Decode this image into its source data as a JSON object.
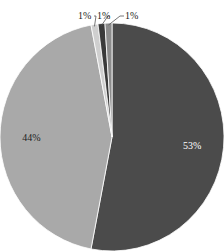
{
  "chart_data": {
    "type": "pie",
    "title": "",
    "slices": [
      {
        "label": "53%",
        "value": 53,
        "color": "#4b4b4b"
      },
      {
        "label": "44%",
        "value": 44,
        "color": "#a9a9a9"
      },
      {
        "label": "1%",
        "value": 1,
        "color": "#cfcfcf"
      },
      {
        "label": "1%",
        "value": 1,
        "color": "#3a3a3a"
      },
      {
        "label": "1%",
        "value": 1,
        "color": "#8c8c8c"
      }
    ],
    "start_angle": "12 o'clock",
    "direction": "clockwise",
    "legend": "none"
  }
}
